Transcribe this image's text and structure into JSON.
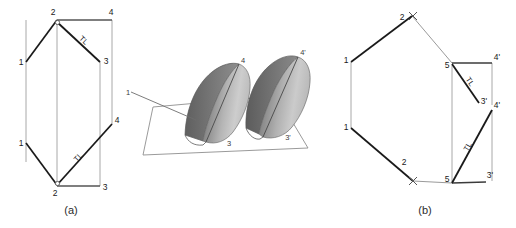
{
  "figure": {
    "type": "descriptive-geometry-plate",
    "background_color": "#ffffff",
    "stroke_dark": "#1a1a1a",
    "stroke_light": "#9a9a9a",
    "surface_dark": "#6e6e6e",
    "surface_light": "#d2d2d2"
  },
  "captions": {
    "a": "(a)",
    "b": "(b)"
  },
  "view_a": {
    "name": "view-a",
    "labels": {
      "top_vertex_2": "2",
      "top_right_4": "4",
      "upper_left_1": "1",
      "upper_right_3": "3",
      "mid_right_4": "4",
      "lower_left_1": "1",
      "bottom_vertex_2": "2",
      "bottom_right_3": "3",
      "tl_upper": "TL",
      "tl_lower": "TL"
    }
  },
  "pictorial": {
    "name": "pictorial-3d",
    "labels": {
      "line_1": "1",
      "left_apex_4": "4",
      "left_base_3": "3",
      "right_apex_4p": "4'",
      "right_base_3p": "3'"
    }
  },
  "view_b": {
    "name": "view-b",
    "labels": {
      "top_2": "2",
      "top_x": "x",
      "left_upper_1": "1",
      "left_lower_1": "1",
      "bottom_2": "2",
      "bottom_x": "x",
      "upper_5": "5",
      "upper_4p": "4'",
      "upper_3p": "3'",
      "lower_5": "5",
      "lower_4p": "4'",
      "lower_3p": "3'",
      "tl_upper": "TL",
      "tl_lower": "TL"
    }
  }
}
